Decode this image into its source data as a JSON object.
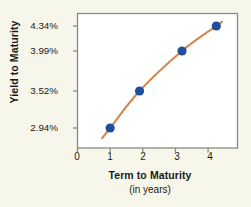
{
  "chart_data": {
    "type": "line",
    "title": "",
    "subtitle": "",
    "xlabel": "Term to Maturity",
    "xlabel_sub": "(in years)",
    "ylabel": "Yield to Maturity",
    "x": [
      1.0,
      1.9,
      3.2,
      4.25
    ],
    "y": [
      2.94,
      3.52,
      3.99,
      4.34
    ],
    "point_labels": [
      "2.94%",
      "3.52%",
      "3.99%",
      "4.34%"
    ],
    "xlim": [
      0,
      4.9
    ],
    "ylim": [
      2.7,
      4.45
    ],
    "xticks": [
      0,
      1,
      2,
      3,
      4
    ],
    "xtick_labels": [
      "0",
      "1",
      "2",
      "3",
      "4"
    ],
    "yticks": [
      2.94,
      3.52,
      3.99,
      4.34
    ],
    "ytick_labels": [
      "2.94%",
      "3.52%",
      "3.99%",
      "4.34%"
    ],
    "grid": false,
    "legend": null,
    "series": [
      {
        "name": "Yield curve",
        "values": [
          2.94,
          3.52,
          3.99,
          4.34
        ],
        "line_color": "#d2884f",
        "marker_color": "#1f4e9c",
        "marker": "circle",
        "smooth": true
      }
    ],
    "colors": {
      "background": "#f7f6ea",
      "plot_background": "#ffffff",
      "axis": "#8a8a80",
      "line": "#d2884f",
      "marker": "#1f4e9c",
      "text": "#1a1a1a"
    }
  }
}
